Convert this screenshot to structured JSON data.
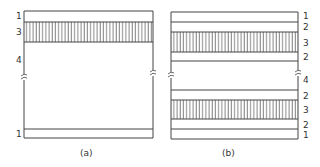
{
  "figure": {
    "panels": [
      {
        "caption": "(a)",
        "layers": [
          {
            "label": "1",
            "type": "plain"
          },
          {
            "label": "3",
            "type": "hatched"
          },
          {
            "label": "4",
            "type": "break"
          },
          {
            "label": "1",
            "type": "plain"
          }
        ]
      },
      {
        "caption": "(b)",
        "layers": [
          {
            "label": "1",
            "type": "plain"
          },
          {
            "label": "2",
            "type": "plain"
          },
          {
            "label": "3",
            "type": "hatched"
          },
          {
            "label": "2",
            "type": "plain"
          },
          {
            "label": "4",
            "type": "break"
          },
          {
            "label": "2",
            "type": "plain"
          },
          {
            "label": "3",
            "type": "hatched"
          },
          {
            "label": "2",
            "type": "plain"
          },
          {
            "label": "1",
            "type": "plain"
          }
        ]
      }
    ],
    "colors": {
      "line": "#444444",
      "background": "#ffffff"
    }
  }
}
